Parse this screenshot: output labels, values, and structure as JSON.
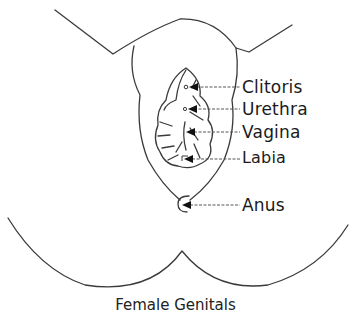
{
  "diagram": {
    "caption": "Female Genitals",
    "labels": [
      {
        "id": "clitoris",
        "text": "Clitoris"
      },
      {
        "id": "urethra",
        "text": "Urethra"
      },
      {
        "id": "vagina",
        "text": "Vagina"
      },
      {
        "id": "labia",
        "text": "Labia"
      },
      {
        "id": "anus",
        "text": "Anus"
      }
    ],
    "colors": {
      "line": "#3a3a3a",
      "leader": "#555555",
      "text": "#1a1a1a",
      "background": "#ffffff"
    }
  }
}
